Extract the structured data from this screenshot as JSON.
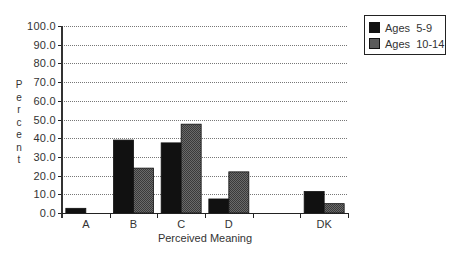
{
  "chart_data": {
    "type": "bar",
    "title": "",
    "xlabel": "Perceived Meaning",
    "ylabel": "Percent",
    "ylim": [
      0,
      100
    ],
    "ytick_step": 10,
    "yticks": [
      "0.0",
      "10.0",
      "20.0",
      "30.0",
      "40.0",
      "50.0",
      "60.0",
      "70.0",
      "80.0",
      "90.0",
      "100.0"
    ],
    "grid": true,
    "legend_position": "top-right, outside plot",
    "categories": [
      "A",
      "B",
      "C",
      "D",
      "",
      "DK"
    ],
    "series": [
      {
        "name": "Ages  5-9",
        "color": "#111111",
        "values": [
          2.5,
          39,
          37.5,
          7.5,
          0,
          11.5
        ]
      },
      {
        "name": "Ages  10-14",
        "color": "#5a5a5a",
        "values": [
          0,
          24,
          47.5,
          22,
          0,
          5
        ]
      }
    ]
  },
  "ylabel_letters": [
    "P",
    "e",
    "r",
    "c",
    "e",
    "n",
    "t"
  ]
}
